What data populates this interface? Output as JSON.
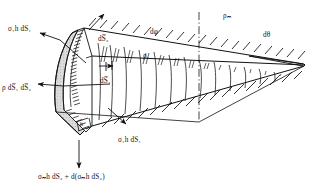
{
  "figure": {
    "type": "engineering-free-body-diagram",
    "background": "#ffffff",
    "ink": "#111111",
    "shade_fill": "#d8d8d8"
  },
  "labels": {
    "sigma1_h_dS1_top": "σ₁h dS₁",
    "rho_dS1_dS2": "ρ dS̅₁ dS̅₂",
    "dS2": "dS̅₂",
    "dS1": "dS̅₁",
    "h": "h",
    "sigma1_h_dS1_bottom": "σ₁h dS₁",
    "d_phi": "dφ",
    "rho_1": "ρ₁",
    "rho_m": "ρₘ",
    "d_theta": "dθ",
    "bottom_equation": "σₘh dS₂ + d(σₘh dS₂)"
  },
  "annotations": {
    "arrow_sigma1_top": "arrow pointing up-right from element top edge",
    "arrow_rho": "arrow pointing left into shaded face",
    "arrow_sigma1_bottom": "arrow pointing down-right from element",
    "arrow_sigma_m": "arrow pointing straight down from element base",
    "centerline": "dash-dot vertical centerline through mid-span",
    "hatching_top": "short oblique hatch marks above upper surface",
    "hatching_bottom": "short oblique hatch marks below lower surface",
    "ribs": "meridional rib lines across the wedge body",
    "serrated_edge": "narrow serrated/hatched strip at the element's curved front face"
  },
  "geometry": {
    "width": 319,
    "height": 192
  }
}
